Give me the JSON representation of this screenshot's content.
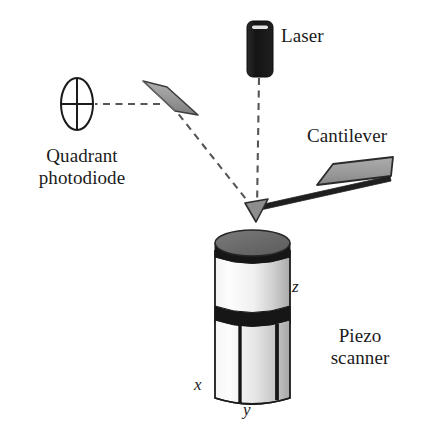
{
  "figure": {
    "background_color": "#ffffff",
    "width": 425,
    "height": 444
  },
  "labels": {
    "laser": "Laser",
    "cantilever": "Cantilever",
    "quadrant_photodiode_line1": "Quadrant",
    "quadrant_photodiode_line2": "photodiode",
    "piezo_scanner_line1": "Piezo",
    "piezo_scanner_line2": "scanner",
    "axis_z": "z",
    "axis_x": "x",
    "axis_y": "y"
  },
  "components": {
    "laser": {
      "name": "laser-diode",
      "shape": "rounded-rectangle",
      "fill": "#1a1a1a",
      "highlight": "#e8e8e8"
    },
    "quadrant_photodiode": {
      "name": "quadrant-photodiode",
      "shape": "ellipse-with-crosshair",
      "fill": "#ffffff",
      "stroke": "#1b1b1b"
    },
    "mirror": {
      "name": "mirror",
      "shape": "tilted-bar",
      "fill": "#9a9a9a",
      "stroke": "#3a3a3a"
    },
    "cantilever": {
      "name": "cantilever",
      "shape": "slanted-chip-with-beam-and-tip",
      "fill": "#9e9e9e",
      "stroke": "#2b2b2b"
    },
    "piezo_scanner": {
      "name": "piezo-scanner-cylinder",
      "shape": "cylinder",
      "top_fill": "#6e6e6e",
      "band_fill": "#161616",
      "body_fill_light": "#fdfdfd",
      "body_fill_shade": "#b8b8b8",
      "stroke": "#1b1b1b"
    },
    "beam_path": {
      "name": "laser-beam-path",
      "style": "dashed",
      "color": "#565656"
    }
  },
  "colors": {
    "ink": "#1b1b1b",
    "gray_part": "#9a9a9a",
    "dark_part": "#1a1a1a",
    "beam_dash": "#565656"
  }
}
